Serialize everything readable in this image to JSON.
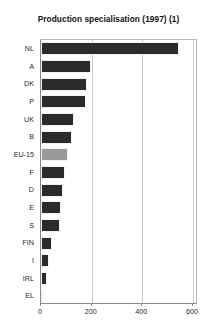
{
  "chart_data": {
    "type": "bar",
    "orientation": "horizontal",
    "title": "Production specialisation (1997) (1)",
    "xlabel": "",
    "ylabel": "",
    "categories": [
      "NL",
      "A",
      "DK",
      "P",
      "UK",
      "B",
      "EU-15",
      "F",
      "D",
      "E",
      "S",
      "FIN",
      "I",
      "IRL",
      "EL"
    ],
    "values": [
      546,
      196,
      182,
      178,
      130,
      122,
      105,
      93,
      85,
      80,
      76,
      44,
      32,
      24,
      5
    ],
    "xlim": [
      0,
      620
    ],
    "xticks": [
      0,
      200,
      400,
      600
    ],
    "xtick_labels": [
      "0",
      "200",
      "400",
      "600"
    ],
    "grid": "vertical",
    "legend": "none",
    "series": [
      {
        "name": "Production specialisation",
        "values": [
          546,
          196,
          182,
          178,
          130,
          122,
          105,
          93,
          85,
          80,
          76,
          44,
          32,
          24,
          5
        ]
      }
    ],
    "highlight_category": "EU-15",
    "colors": {
      "bar": "#2b2b2b",
      "highlight_bar": "#9a9a9a",
      "gridline": "#c9c9c9",
      "axis": "#8a8a8a",
      "background": "#ffffff",
      "text": "#1a1a1a"
    }
  }
}
